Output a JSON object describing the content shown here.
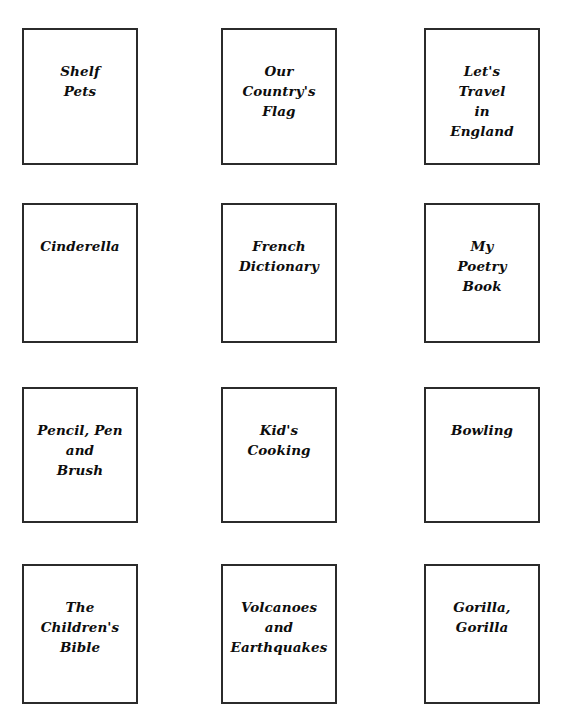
{
  "page": {
    "background_color": "#ffffff",
    "width": 565,
    "height": 726,
    "top_edge_artifact": "",
    "border_color": "#2b2b2b",
    "text_color": "#0d0d0d"
  },
  "grid": {
    "columns": 3,
    "rows": 4,
    "column_x": [
      22,
      221,
      424
    ],
    "row_y": [
      28,
      203,
      387,
      564
    ],
    "box_width": 116,
    "box_heights": [
      137,
      140,
      136,
      140
    ]
  },
  "books": [
    {
      "row": 1,
      "column": 1,
      "title": "Shelf\nPets",
      "lines": [
        "Shelf",
        "Pets"
      ]
    },
    {
      "row": 1,
      "column": 2,
      "title": "Our\nCountry's\nFlag",
      "lines": [
        "Our",
        "Country's",
        "Flag"
      ]
    },
    {
      "row": 1,
      "column": 3,
      "title": "Let's\nTravel\nin\nEngland",
      "lines": [
        "Let's",
        "Travel",
        "in",
        "England"
      ]
    },
    {
      "row": 2,
      "column": 1,
      "title": "Cinderella",
      "lines": [
        "Cinderella"
      ]
    },
    {
      "row": 2,
      "column": 2,
      "title": "French\nDictionary",
      "lines": [
        "French",
        "Dictionary"
      ]
    },
    {
      "row": 2,
      "column": 3,
      "title": "My\nPoetry\nBook",
      "lines": [
        "My",
        "Poetry",
        "Book"
      ]
    },
    {
      "row": 3,
      "column": 1,
      "title": "Pencil, Pen\nand\nBrush",
      "lines": [
        "Pencil, Pen",
        "and",
        "Brush"
      ]
    },
    {
      "row": 3,
      "column": 2,
      "title": "Kid's\nCooking",
      "lines": [
        "Kid's",
        "Cooking"
      ]
    },
    {
      "row": 3,
      "column": 3,
      "title": "Bowling",
      "lines": [
        "Bowling"
      ]
    },
    {
      "row": 4,
      "column": 1,
      "title": "The\nChildren's\nBible",
      "lines": [
        "The",
        "Children's",
        "Bible"
      ]
    },
    {
      "row": 4,
      "column": 2,
      "title": "Volcanoes\nand\nEarthquakes",
      "lines": [
        "Volcanoes",
        "and",
        "Earthquakes"
      ]
    },
    {
      "row": 4,
      "column": 3,
      "title": "Gorilla,\nGorilla",
      "lines": [
        "Gorilla,",
        "Gorilla"
      ]
    }
  ]
}
